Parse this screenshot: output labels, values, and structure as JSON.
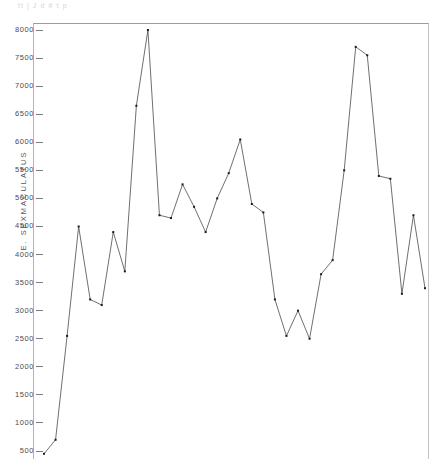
{
  "scan_header": {
    "text": "tt  j      J      d                 #                  t                                      p"
  },
  "axes": {
    "y_title": "E. SEXMACULATUS",
    "y_ticks": [
      8000,
      7500,
      7000,
      6500,
      6000,
      5500,
      5000,
      4500,
      4000,
      3500,
      3000,
      2500,
      2000,
      1500,
      1000,
      500
    ],
    "y_min": 0,
    "y_max": 8250,
    "x_title": ""
  },
  "style": {
    "line_color": "#4a4a50",
    "marker_color": "#1c1c20",
    "frame_color": "#9b9ba0",
    "background": "#ffffff"
  },
  "chart_data": {
    "type": "line",
    "title": "",
    "subtitle": "",
    "xlabel": "",
    "ylabel": "E. SEXMACULATUS",
    "ylim": [
      0,
      8250
    ],
    "xlim": [
      0,
      35
    ],
    "grid": false,
    "legend": "none",
    "markers": "dot",
    "x": [
      1,
      2,
      3,
      4,
      5,
      6,
      7,
      8,
      9,
      10,
      11,
      12,
      13,
      14,
      15,
      16,
      17,
      18,
      19,
      20,
      21,
      22,
      23,
      24,
      25,
      26,
      27,
      28,
      29,
      30,
      31,
      32,
      33,
      34
    ],
    "values": [
      450,
      700,
      2550,
      4500,
      3200,
      3100,
      4400,
      3700,
      6650,
      8000,
      4700,
      4650,
      5250,
      4850,
      4400,
      5000,
      5450,
      6050,
      4900,
      4750,
      3200,
      2550,
      3000,
      2500,
      3650,
      3900,
      5500,
      7700,
      7550,
      5400,
      5350,
      3300,
      4700,
      3400
    ],
    "series": [
      {
        "name": "E. sexmaculatus",
        "values": [
          450,
          700,
          2550,
          4500,
          3200,
          3100,
          4400,
          3700,
          6650,
          8000,
          4700,
          4650,
          5250,
          4850,
          4400,
          5000,
          5450,
          6050,
          4900,
          4750,
          3200,
          2550,
          3000,
          2500,
          3650,
          3900,
          5500,
          7700,
          7550,
          5400,
          5350,
          3300,
          4700,
          3400
        ]
      }
    ],
    "annotations": []
  }
}
